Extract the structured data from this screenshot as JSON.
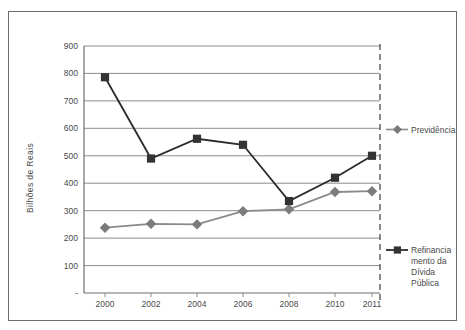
{
  "chart_data": {
    "type": "line",
    "title": "",
    "subtitle": "",
    "xlabel": "",
    "ylabel": "Bilhões de Reais",
    "categories": [
      "2000",
      "2002",
      "2004",
      "2006",
      "2008",
      "2010",
      "2011"
    ],
    "x_tick_labels": [
      "2000",
      "2002",
      "2004",
      "2006",
      "2008",
      "2010",
      "2011"
    ],
    "y_tick_labels": [
      "900",
      "800",
      "700",
      "600",
      "500",
      "400",
      "300",
      "200",
      "100",
      "-"
    ],
    "y_tick_values": [
      900,
      800,
      700,
      600,
      500,
      400,
      300,
      200,
      100,
      0
    ],
    "ylim": [
      0,
      900
    ],
    "grid": true,
    "grid_axis": "y",
    "legend_position": "right",
    "series": [
      {
        "name": "Previdência",
        "legend_lines": [
          "Previdência"
        ],
        "marker": "diamond",
        "color": "#7b7b7b",
        "line_color": "#8a8a8a",
        "values": [
          238,
          252,
          250,
          298,
          305,
          368,
          371
        ]
      },
      {
        "name": "Refinanciamento da Dívida Pública",
        "legend_lines": [
          "Refinancia",
          "mento da",
          "Dívida",
          "Pública"
        ],
        "marker": "square",
        "color": "#333333",
        "line_color": "#2b2b2b",
        "values": [
          786,
          490,
          562,
          540,
          335,
          420,
          500
        ]
      }
    ],
    "annotations": [
      {
        "name": "right-boundary-dashed-line",
        "type": "vertical-dashed-line",
        "at_x": "right-edge"
      }
    ]
  },
  "colors": {
    "grid": "#8c8c8c",
    "axis": "#6e6e6e",
    "frame": "#6e6e6e",
    "text": "#4a4a4a",
    "series_previdencia": "#7b7b7b",
    "series_refinanciamento": "#333333",
    "background": "#ffffff"
  }
}
